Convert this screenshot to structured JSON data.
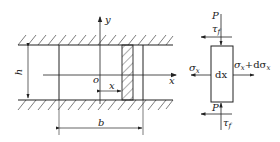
{
  "diagram": {
    "left_figure": {
      "axis_y_label": "y",
      "axis_x_label": "x",
      "origin_label": "o",
      "height_label": "h",
      "width_label": "b",
      "offset_label": "x"
    },
    "right_figure": {
      "top_force_label": "P",
      "top_friction_label": "τ",
      "top_friction_sub": "f",
      "bottom_force_label": "P",
      "bottom_friction_label": "τ",
      "bottom_friction_sub": "f",
      "left_stress_label": "σ",
      "left_stress_sub": "x",
      "right_stress_label": "σ",
      "right_stress_sub": "x",
      "right_stress_plus": "+dσ",
      "right_stress_sub2": "x",
      "element_label": "dx"
    },
    "colors": {
      "stroke": "#222222",
      "background": "#ffffff"
    }
  }
}
